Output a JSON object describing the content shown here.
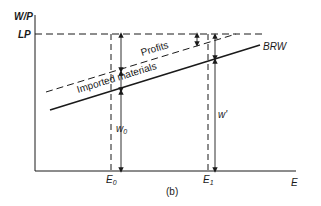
{
  "diagram": {
    "caption": "(b)",
    "axes": {
      "y_label": "W/P",
      "x_label": "E",
      "y_tick_label": "LP"
    },
    "x_marks": [
      {
        "label": "E",
        "sub": "0"
      },
      {
        "label": "E",
        "sub": "1"
      }
    ],
    "curves": {
      "brw_label": "BRW",
      "profits_label": "Profits",
      "imported_label": "Imported materials"
    },
    "measures": {
      "w0_label": "w",
      "w0_sub": "0",
      "w1_label": "w'"
    },
    "colors": {
      "ink": "#1a1a1a",
      "background": "#ffffff"
    }
  }
}
